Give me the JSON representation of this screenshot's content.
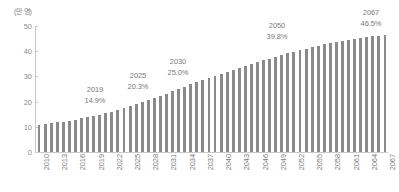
{
  "chart_data": {
    "type": "bar",
    "title": "",
    "subtitle": "",
    "xlabel": "",
    "ylabel": "(만 명)",
    "unit_label": "(만 명)",
    "ylim": [
      0,
      50
    ],
    "yticks": [
      0,
      10,
      20,
      30,
      40,
      50
    ],
    "ytick_labels": [
      "0",
      "10",
      "20",
      "30",
      "40",
      "50"
    ],
    "grid": false,
    "legend": null,
    "bar_color": "#8a8a8a",
    "axis_color": "#c9c9c9",
    "text_color": "#7d7d7d",
    "xtick_step": 3,
    "categories": [
      "2010",
      "2011",
      "2012",
      "2013",
      "2014",
      "2015",
      "2016",
      "2017",
      "2018",
      "2019",
      "2020",
      "2021",
      "2022",
      "2023",
      "2024",
      "2025",
      "2026",
      "2027",
      "2028",
      "2029",
      "2030",
      "2031",
      "2032",
      "2033",
      "2034",
      "2035",
      "2036",
      "2037",
      "2038",
      "2039",
      "2040",
      "2041",
      "2042",
      "2043",
      "2044",
      "2045",
      "2046",
      "2047",
      "2048",
      "2049",
      "2050",
      "2051",
      "2052",
      "2053",
      "2054",
      "2055",
      "2056",
      "2057",
      "2058",
      "2059",
      "2060",
      "2061",
      "2062",
      "2063",
      "2064",
      "2065",
      "2066",
      "2067"
    ],
    "xtick_labels": [
      "2010",
      "2013",
      "2016",
      "2019",
      "2022",
      "2025",
      "2028",
      "2031",
      "2034",
      "2037",
      "2040",
      "2043",
      "2046",
      "2049",
      "2052",
      "2055",
      "2058",
      "2061",
      "2064",
      "2067"
    ],
    "values": [
      10.9,
      11.2,
      11.5,
      11.8,
      12.1,
      12.5,
      12.9,
      13.3,
      13.8,
      14.2,
      14.7,
      15.3,
      16.0,
      16.8,
      17.6,
      18.4,
      19.2,
      20.0,
      20.8,
      21.6,
      22.4,
      23.2,
      24.1,
      25.0,
      25.9,
      26.8,
      27.6,
      28.5,
      29.3,
      30.1,
      31.0,
      31.8,
      32.6,
      33.4,
      34.1,
      34.9,
      35.6,
      36.4,
      37.1,
      37.8,
      38.5,
      39.2,
      39.8,
      40.4,
      41.0,
      41.6,
      42.2,
      42.7,
      43.2,
      43.7,
      44.1,
      44.5,
      44.9,
      45.3,
      45.6,
      45.9,
      46.2,
      46.5
    ],
    "annotations": [
      {
        "year": "2019",
        "value": "14.9%",
        "index": 9,
        "x": 95,
        "y": 84
      },
      {
        "year": "2025",
        "value": "20.3%",
        "index": 15,
        "x": 138,
        "y": 70
      },
      {
        "year": "2030",
        "value": "25.0%",
        "index": 20,
        "x": 178,
        "y": 56
      },
      {
        "year": "2050",
        "value": "39.8%",
        "index": 40,
        "x": 277,
        "y": 20
      },
      {
        "year": "2067",
        "value": "46.5%",
        "index": 57,
        "x": 371,
        "y": 7
      }
    ]
  }
}
